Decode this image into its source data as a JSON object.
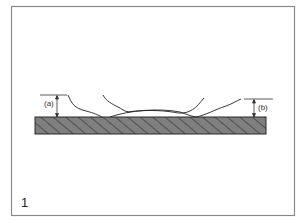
{
  "figure": {
    "number": "1",
    "labels": {
      "a": "(a)",
      "b": "(b)"
    },
    "colors": {
      "frame": "#888888",
      "substrate_fill": "#7a7a7a",
      "hatch": "#333333",
      "curve": "#222222"
    }
  }
}
